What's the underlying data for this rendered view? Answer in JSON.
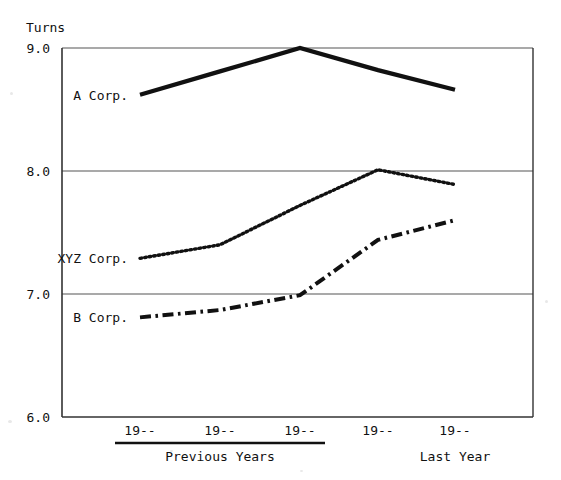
{
  "chart_data": {
    "type": "line",
    "title": "",
    "ylabel": "Turns",
    "xlabel": "",
    "ylim": [
      6.0,
      9.0
    ],
    "yticks": [
      "6.0",
      "7.0",
      "8.0",
      "9.0"
    ],
    "ytick_values": [
      6.0,
      7.0,
      8.0,
      9.0
    ],
    "gridlines": [
      "7.0",
      "8.0",
      "9.0"
    ],
    "grid": true,
    "legend_position": "inline-left-of-series",
    "categories": [
      "19--",
      "19--",
      "19--",
      "19--",
      "19--"
    ],
    "xtick_labels": [
      "19--",
      "19--",
      "19--",
      "19--",
      "19--"
    ],
    "x_group_labels": [
      {
        "label": "Previous Years",
        "spans": [
          0,
          1,
          2
        ],
        "underline": true
      },
      {
        "label": "Last Year",
        "spans": [
          4
        ],
        "underline": false
      }
    ],
    "series": [
      {
        "name": "A Corp.",
        "label": "A Corp.",
        "style": "solid",
        "color": "#111111",
        "values": [
          8.62,
          8.81,
          9.0,
          8.82,
          8.66
        ]
      },
      {
        "name": "XYZ Corp.",
        "label": "XYZ Corp.",
        "style": "dotted",
        "color": "#111111",
        "values": [
          7.29,
          7.4,
          7.72,
          8.01,
          7.89
        ]
      },
      {
        "name": "B Corp.",
        "label": "B Corp.",
        "style": "dash-dot",
        "color": "#111111",
        "values": [
          6.81,
          6.87,
          6.99,
          7.44,
          7.6
        ]
      }
    ]
  },
  "axis": {
    "y_axis_title": "Turns"
  },
  "colors": {
    "ink": "#111111",
    "grid": "#555555",
    "frame": "#333333",
    "paper": "#ffffff"
  }
}
